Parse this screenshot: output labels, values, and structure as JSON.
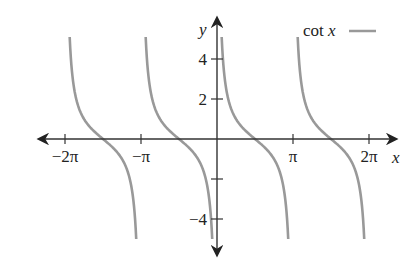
{
  "chart_data": {
    "type": "line",
    "title": "",
    "xlabel": "x",
    "ylabel": "y",
    "function": "cot x",
    "xlim": [
      -7.2,
      7.5
    ],
    "ylim": [
      -5.8,
      6.1
    ],
    "x_ticks": [
      {
        "value": -6.2832,
        "label": "−2π"
      },
      {
        "value": -3.1416,
        "label": "−π"
      },
      {
        "value": 3.1416,
        "label": "π"
      },
      {
        "value": 6.2832,
        "label": "2π"
      }
    ],
    "y_ticks": [
      {
        "value": 4,
        "label": "4"
      },
      {
        "value": 2,
        "label": "2"
      },
      {
        "value": -2,
        "label": ""
      },
      {
        "value": -4,
        "label": "−4"
      }
    ],
    "legend": [
      {
        "name": "cot x",
        "color": "#999999"
      }
    ],
    "legend_position": "top-right",
    "grid": false,
    "series": [
      {
        "name": "cot x",
        "color": "#999999",
        "branches": [
          {
            "domain": [
              -6.2832,
              -3.1416
            ],
            "y_range": [
              -5,
              5.1
            ],
            "zero_at": -4.7124
          },
          {
            "domain": [
              -3.1416,
              0
            ],
            "y_range": [
              -5,
              5.1
            ],
            "zero_at": -1.5708
          },
          {
            "domain": [
              0,
              3.1416
            ],
            "y_range": [
              -5,
              5.1
            ],
            "zero_at": 1.5708
          },
          {
            "domain": [
              3.1416,
              6.2832
            ],
            "y_range": [
              -5,
              5.1
            ],
            "zero_at": 4.7124
          }
        ]
      }
    ],
    "asymptotes": [
      -6.2832,
      -3.1416,
      0,
      3.1416,
      6.2832
    ]
  },
  "labels": {
    "x_axis": "x",
    "y_axis": "y",
    "legend_text": "cot x"
  }
}
